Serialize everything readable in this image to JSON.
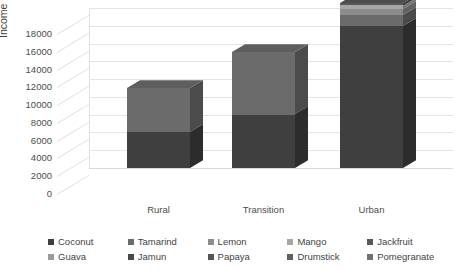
{
  "chart_data": {
    "type": "bar",
    "subtype": "stacked-column-3d",
    "title": "",
    "xlabel": "",
    "ylabel": "Income in Rs/household/year",
    "categories": [
      "Rural",
      "Transition",
      "Urban"
    ],
    "ylim": [
      0,
      18000
    ],
    "ytick_values": [
      0,
      2000,
      4000,
      6000,
      8000,
      10000,
      12000,
      14000,
      16000,
      18000
    ],
    "ytick_labels": [
      "0",
      "2000",
      "4000",
      "6000",
      "8000",
      "10000",
      "12000",
      "14000",
      "16000",
      "18000"
    ],
    "grid": true,
    "legend_position": "bottom",
    "series": [
      {
        "name": "Coconut",
        "values": [
          4000,
          6000,
          16000
        ],
        "color": "#3f3f3f"
      },
      {
        "name": "Tamarind",
        "values": [
          5000,
          7000,
          1200
        ],
        "color": "#6b6b6b"
      },
      {
        "name": "Lemon",
        "values": [
          0,
          0,
          700
        ],
        "color": "#8c8c8c"
      },
      {
        "name": "Mango",
        "values": [
          0,
          0,
          400
        ],
        "color": "#a6a6a6"
      },
      {
        "name": "Jackfruit",
        "values": [
          0,
          0,
          300
        ],
        "color": "#585858"
      },
      {
        "name": "Guava",
        "values": [
          0,
          0,
          0
        ],
        "color": "#9a9a9a"
      },
      {
        "name": "Jamun",
        "values": [
          0,
          0,
          0
        ],
        "color": "#484848"
      },
      {
        "name": "Papaya",
        "values": [
          0,
          0,
          0
        ],
        "color": "#545454"
      },
      {
        "name": "Drumstick",
        "values": [
          0,
          0,
          0
        ],
        "color": "#626262"
      },
      {
        "name": "Pomegranate",
        "values": [
          0,
          0,
          0
        ],
        "color": "#717171"
      }
    ],
    "totals": [
      9000,
      13000,
      18600
    ]
  },
  "axis": {
    "y_title": "Income in Rs/household/year",
    "ticks": [
      "18000",
      "16000",
      "14000",
      "12000",
      "10000",
      "8000",
      "6000",
      "4000",
      "2000",
      "0"
    ]
  },
  "categories": {
    "c0": "Rural",
    "c1": "Transition",
    "c2": "Urban"
  },
  "legend": {
    "row1": [
      {
        "label": "Coconut"
      },
      {
        "label": "Tamarind"
      },
      {
        "label": "Lemon"
      },
      {
        "label": "Mango"
      },
      {
        "label": "Jackfruit"
      }
    ],
    "row2": [
      {
        "label": "Guava"
      },
      {
        "label": "Jamun"
      },
      {
        "label": "Papaya"
      },
      {
        "label": "Drumstick"
      },
      {
        "label": "Pomegranate"
      }
    ]
  },
  "colors": {
    "grid": "#e4e4e4",
    "text": "#4d4d4d",
    "background": "#ffffff",
    "bar_dark": "#3f3f3f",
    "bar_mid": "#6b6b6b",
    "bar_light": "#8c8c8c"
  }
}
